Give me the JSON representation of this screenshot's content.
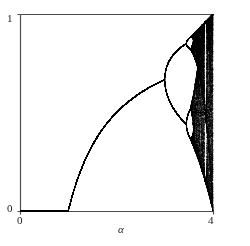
{
  "figure": {
    "type": "bifurcation-diagram",
    "background_color": "#ffffff",
    "ink_color": "#000000",
    "axis_color": "#4d4d4d"
  },
  "axes": {
    "frame": {
      "left": 20,
      "top": 14,
      "right": 213,
      "bottom": 211
    },
    "x_axis": {
      "title": "α",
      "min": 0,
      "max": 4,
      "tick_labels": [
        "0",
        "4"
      ],
      "tick_values": [
        0,
        4
      ]
    },
    "y_axis": {
      "title": "",
      "min": 0,
      "max": 1,
      "tick_labels": [
        "0",
        "1"
      ],
      "tick_values": [
        0,
        1
      ]
    }
  },
  "chart_data": {
    "type": "scatter",
    "title": "",
    "subtitle": "",
    "xlabel": "α",
    "ylabel": "",
    "xlim": [
      0,
      4
    ],
    "ylim": [
      0,
      1
    ],
    "grid": false,
    "legend": null,
    "map": "logistic",
    "equation": "x(n+1) = a * x(n) * (1 - x(n))",
    "parameter_name": "α",
    "parameter_min": 0,
    "parameter_max": 4,
    "parameter_steps": 1400,
    "transient_iterations": 300,
    "plotted_iterations": 260,
    "initial_x": 0.35,
    "point_size": 0.55,
    "features": [
      {
        "label": "fixed-point-zero",
        "alpha_range": [
          0,
          1
        ],
        "x_value": 0
      },
      {
        "label": "fixed-point-nonzero",
        "alpha_range": [
          1,
          3
        ],
        "x_formula": "1 - 1/a"
      },
      {
        "label": "first-period-doubling",
        "alpha": 3.0,
        "x_value": 0.6667
      },
      {
        "label": "second-period-doubling",
        "alpha": 3.449,
        "x_values": [
          0.44,
          0.8499
        ]
      },
      {
        "label": "third-period-doubling",
        "alpha": 3.544,
        "x_values": [
          0.37,
          0.52,
          0.82,
          0.88
        ]
      },
      {
        "label": "accumulation-point",
        "alpha": 3.5699
      },
      {
        "label": "period-3-window",
        "alpha_range": [
          3.828,
          3.857
        ]
      },
      {
        "label": "chaotic-band",
        "alpha_range": [
          3.5699,
          4.0
        ],
        "x_range": [
          0,
          1
        ]
      }
    ],
    "annotations": []
  }
}
